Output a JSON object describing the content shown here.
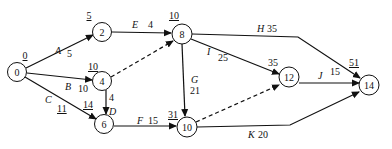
{
  "diagram": {
    "type": "activity-on-arrow network",
    "nodes": [
      {
        "id": "0",
        "label": "0",
        "earliest": "0",
        "x": 17,
        "y": 72
      },
      {
        "id": "2",
        "label": "2",
        "earliest": "5",
        "x": 102,
        "y": 32
      },
      {
        "id": "4",
        "label": "4",
        "earliest": "10",
        "x": 102,
        "y": 81
      },
      {
        "id": "6",
        "label": "6",
        "earliest": "14",
        "x": 104,
        "y": 124
      },
      {
        "id": "8",
        "label": "8",
        "earliest": "10",
        "x": 182,
        "y": 34
      },
      {
        "id": "10",
        "label": "10",
        "earliest": "31",
        "x": 187,
        "y": 127
      },
      {
        "id": "12",
        "label": "12",
        "earliest": "35",
        "x": 289,
        "y": 77
      },
      {
        "id": "14",
        "label": "14",
        "earliest": "51",
        "x": 369,
        "y": 85
      }
    ],
    "activities": [
      {
        "name": "A",
        "duration": "5",
        "from": "0",
        "to": "2",
        "dashed": false
      },
      {
        "name": "B",
        "duration": "10",
        "from": "0",
        "to": "4",
        "dashed": false
      },
      {
        "name": "C",
        "duration": "11",
        "from": "0",
        "to": "6",
        "dashed": false
      },
      {
        "name": "D",
        "duration": "4",
        "from": "4",
        "to": "6",
        "dashed": false
      },
      {
        "name": "E",
        "duration": "4",
        "from": "2",
        "to": "8",
        "dashed": false
      },
      {
        "name": "F",
        "duration": "15",
        "from": "6",
        "to": "10",
        "dashed": false
      },
      {
        "name": "G",
        "duration": "21",
        "from": "8",
        "to": "10",
        "dashed": false
      },
      {
        "name": "H",
        "duration": "35",
        "from": "8",
        "to": "14",
        "dashed": false
      },
      {
        "name": "I",
        "duration": "25",
        "from": "8",
        "to": "12",
        "dashed": false
      },
      {
        "name": "J",
        "duration": "15",
        "from": "12",
        "to": "14",
        "dashed": false
      },
      {
        "name": "K",
        "duration": "20",
        "from": "10",
        "to": "14",
        "dashed": false
      },
      {
        "name": "",
        "duration": "",
        "from": "4",
        "to": "8",
        "dashed": true
      },
      {
        "name": "",
        "duration": "",
        "from": "10",
        "to": "12",
        "dashed": true
      }
    ]
  },
  "labels": {
    "n0": "0",
    "n2": "2",
    "n4": "4",
    "n6": "6",
    "n8": "8",
    "n10": "10",
    "n12": "12",
    "n14": "14",
    "e0": "0",
    "e2": "5",
    "e4": "10",
    "e6": "14",
    "e8": "10",
    "e10": "31",
    "e12": "35",
    "e14": "51",
    "A": "A",
    "A_d": "5",
    "B": "B",
    "B_d": "10",
    "C": "C",
    "C_d": "11",
    "D": "D",
    "D_d": "4",
    "E": "E",
    "E_d": "4",
    "F": "F",
    "F_d": "15",
    "G": "G",
    "G_d": "21",
    "H": "H",
    "H_d": "35",
    "I": "I",
    "I_d": "25",
    "J": "J",
    "J_d": "15",
    "K": "K",
    "K_d": "20"
  },
  "colors": {
    "stroke": "#111111",
    "background": "#ffffff"
  }
}
